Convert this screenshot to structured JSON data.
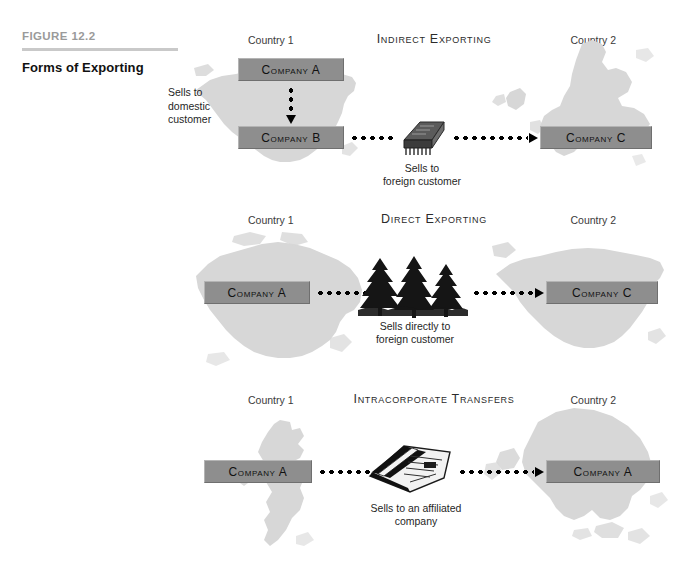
{
  "figure": {
    "number": "FIGURE 12.2",
    "title": "Forms of Exporting"
  },
  "colors": {
    "company_box_fill": "#8e8e8e",
    "map_fill": "#d7d7d7",
    "rule": "#c9c9c9",
    "figure_number_text": "#9a9a9a",
    "connector": "#000000"
  },
  "panels": [
    {
      "id": "indirect-exporting",
      "title": "Indirect Exporting",
      "country_left_label": "Country 1",
      "country_right_label": "Country 2",
      "left_map": "united-states-map",
      "right_map": "europe-map",
      "boxes": [
        {
          "name": "company-a-box",
          "label": "Company A"
        },
        {
          "name": "company-b-box",
          "label": "Company B"
        },
        {
          "name": "company-c-box",
          "label": "Company C"
        }
      ],
      "side_note": "Sells to\ndomestic\ncustomer",
      "center_icon": "microchip-icon",
      "center_note": "Sells to\nforeign customer"
    },
    {
      "id": "direct-exporting",
      "title": "Direct Exporting",
      "country_left_label": "Country 1",
      "country_right_label": "Country 2",
      "left_map": "canada-map",
      "right_map": "united-states-map",
      "boxes": [
        {
          "name": "company-a-box",
          "label": "Company A"
        },
        {
          "name": "company-c-box",
          "label": "Company C"
        }
      ],
      "center_icon": "pine-trees-icon",
      "center_note": "Sells directly to\nforeign customer"
    },
    {
      "id": "intracorporate-transfers",
      "title": "Intracorporate Transfers",
      "country_left_label": "Country 1",
      "country_right_label": "Country 2",
      "left_map": "united-kingdom-map",
      "right_map": "asia-map",
      "boxes": [
        {
          "name": "company-a-box-origin",
          "label": "Company A"
        },
        {
          "name": "company-a-box-destination",
          "label": "Company A"
        }
      ],
      "center_icon": "newspaper-icon",
      "center_note": "Sells to an affiliated\ncompany"
    }
  ]
}
